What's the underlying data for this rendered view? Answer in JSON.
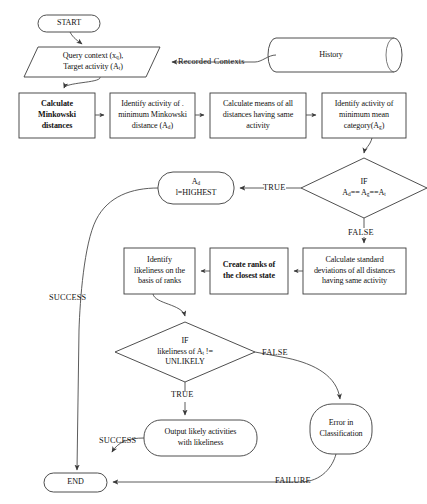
{
  "diagram": {
    "style": {
      "background": "#ffffff",
      "stroke": "#3b3b3b",
      "text": "#121212"
    }
  },
  "nodes": {
    "start": {
      "label": "START",
      "shape": "terminator"
    },
    "query_input": {
      "line1": "Query context (x",
      "sub1": "q",
      "line1_end": "),",
      "line2": "Target activity  (A",
      "sub2": "t",
      "line2_end": ")",
      "shape": "parallelogram"
    },
    "history": {
      "label": "History",
      "shape": "cylinder"
    },
    "calc_minkowski": {
      "line1": "Calculate",
      "line2": "Minkowski",
      "line3": "distances",
      "shape": "process",
      "bold": true
    },
    "identify_min_minkowski": {
      "line1": "Identify activity of .",
      "line2": "minimum Minkowski",
      "line3": "distance (A",
      "sub3": "d",
      "line3_end": ")",
      "shape": "process"
    },
    "calc_means": {
      "line1": "Calculate means of all",
      "line2": "distances having same",
      "line3": "activity",
      "shape": "process"
    },
    "identify_min_mean": {
      "line1": "Identify activity of",
      "line2": "minimum mean",
      "line3": "category(A",
      "sub3": "g",
      "line3_end": ")",
      "shape": "process"
    },
    "decision_equal": {
      "line1": "IF",
      "line2_a": "A",
      "sub2_a": "d",
      "line2_b": "== A",
      "sub2_b": "g",
      "line2_c": "==A",
      "sub2_c": "t",
      "shape": "decision"
    },
    "highest": {
      "line1": "A",
      "sub1": "d",
      "line2": "l=HIGHEST",
      "shape": "terminator"
    },
    "calc_std": {
      "line1": "Calculate standard",
      "line2": "deviations of all distances",
      "line3": "having same activity",
      "shape": "process"
    },
    "create_ranks": {
      "line1": "Create ranks of",
      "line2": "the closest state",
      "shape": "process",
      "bold": true
    },
    "identify_likeliness": {
      "line1": "Identify",
      "line2": "likeliness on the",
      "line3": "basis of ranks",
      "shape": "process"
    },
    "decision_unlikely": {
      "line1": "IF",
      "line2_a": "likeliness of A",
      "sub2": "t",
      "line2_b": " !=",
      "line3": "UNLIKELY",
      "shape": "decision"
    },
    "output_likely": {
      "line1": "Output likely activities",
      "line2": "with likeliness",
      "shape": "terminator"
    },
    "error_classification": {
      "line1": "Error in",
      "line2": "Classification",
      "shape": "terminator"
    },
    "end": {
      "label": "END",
      "shape": "terminator"
    }
  },
  "edge_labels": {
    "recorded_contexts": "Recorded Contexts",
    "true_equal": "TRUE",
    "false_equal": "FALSE",
    "success_highest": "SUCCESS",
    "true_unlikely": "TRUE",
    "false_unlikely": "FALSE",
    "success_output": "SUCCESS",
    "failure_error": "FAILURE"
  }
}
